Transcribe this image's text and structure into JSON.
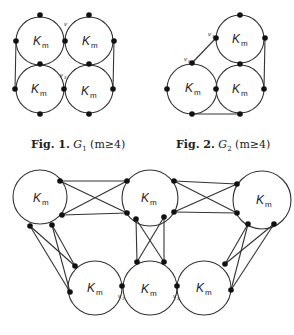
{
  "figures": [
    {
      "id": "fig1",
      "caption": {
        "label": "Fig. 1.",
        "graph": "G",
        "sub": "1",
        "cond": "(m≥4)"
      },
      "node_label": "K",
      "node_sub": "m",
      "vertex_labels": [
        "v",
        "v"
      ]
    },
    {
      "id": "fig2",
      "caption": {
        "label": "Fig. 2.",
        "graph": "G",
        "sub": "2",
        "cond": "(m≥4)"
      },
      "node_label": "K",
      "node_sub": "m",
      "vertex_labels": [
        "v1",
        "v0"
      ]
    },
    {
      "id": "fig3",
      "node_label": "K",
      "node_sub": "m",
      "vertex_labels": [
        "v1",
        "v2"
      ]
    }
  ],
  "colors": {
    "stroke": "#333333",
    "dot": "#111111",
    "text": "#222222"
  }
}
